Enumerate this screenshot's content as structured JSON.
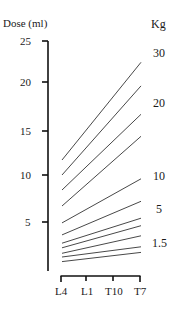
{
  "chart_data": {
    "type": "line",
    "title": "",
    "ylabel": "Dose (ml)",
    "xlabel": "",
    "right_label": "Kg",
    "categories": [
      "L4",
      "L1",
      "T10",
      "T7"
    ],
    "ylim": [
      0,
      25
    ],
    "yticks": [
      25,
      20,
      15,
      10,
      5
    ],
    "grid": false,
    "legend": "none",
    "series": [
      {
        "name": "line 1",
        "L4": 11.7,
        "T7": 22.4
      },
      {
        "name": "line 2",
        "L4": 10.0,
        "T7": 19.6
      },
      {
        "name": "line 3",
        "L4": 8.4,
        "T7": 16.7
      },
      {
        "name": "line 4",
        "L4": 6.7,
        "T7": 14.4
      },
      {
        "name": "line 5",
        "L4": 4.9,
        "T7": 9.6
      },
      {
        "name": "line 6",
        "L4": 3.6,
        "T7": 7.2
      },
      {
        "name": "line 7",
        "L4": 2.7,
        "T7": 5.4
      },
      {
        "name": "line 8",
        "L4": 2.2,
        "T7": 4.6
      },
      {
        "name": "line 9",
        "L4": 1.6,
        "T7": 3.5
      },
      {
        "name": "line 10",
        "L4": 1.2,
        "T7": 2.3
      },
      {
        "name": "line 11",
        "L4": 0.7,
        "T7": 1.7
      }
    ],
    "annotations": [
      {
        "text": "30",
        "y_px": 53
      },
      {
        "text": "20",
        "y_px": 103
      },
      {
        "text": "10",
        "y_px": 176
      },
      {
        "text": "5",
        "y_px": 209
      },
      {
        "text": "1.5",
        "y_px": 243
      }
    ]
  },
  "labels": {
    "y_axis_title": "Dose (ml)",
    "right_title": "Kg",
    "ytick_25": "25",
    "ytick_20": "20",
    "ytick_15": "15",
    "ytick_10": "10",
    "ytick_5": "5",
    "x_L4": "L4",
    "x_L1": "L1",
    "x_T10": "T10",
    "x_T7": "T7",
    "kg_30": "30",
    "kg_20": "20",
    "kg_10": "10",
    "kg_5": "5",
    "kg_1_5": "1.5"
  }
}
